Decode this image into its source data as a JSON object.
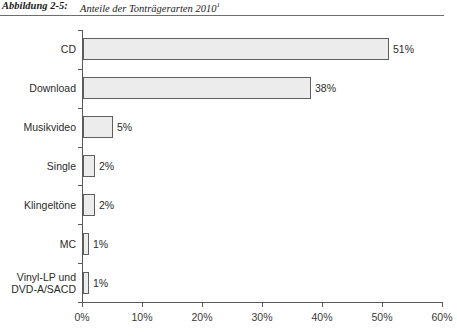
{
  "caption": {
    "number": "Abbildung 2-5:",
    "text": "Anteile der Tonträgerarten 2010",
    "footnote_marker": "1"
  },
  "chart_data": {
    "type": "bar",
    "orientation": "horizontal",
    "title": "Anteile der Tonträgerarten 2010",
    "xlabel": "",
    "ylabel": "",
    "xlim": [
      0,
      60
    ],
    "grid": false,
    "legend": "none",
    "categories": [
      "CD",
      "Download",
      "Musikvideo",
      "Single",
      "Klingeltöne",
      "MC",
      "Vinyl-LP und\nDVD-A/SACD"
    ],
    "values": [
      51,
      38,
      5,
      2,
      2,
      1,
      1
    ],
    "data_labels": [
      "51%",
      "38%",
      "5%",
      "2%",
      "2%",
      "1%",
      "1%"
    ],
    "xtick_labels": [
      "0%",
      "10%",
      "20%",
      "30%",
      "40%",
      "50%",
      "60%"
    ],
    "xtick_values": [
      0,
      10,
      20,
      30,
      40,
      50,
      60
    ],
    "colors": {
      "bar_fill": "#ececec",
      "bar_border": "#5f5f5f",
      "axis": "#5a5a5a",
      "text": "#2b2b2b"
    }
  }
}
